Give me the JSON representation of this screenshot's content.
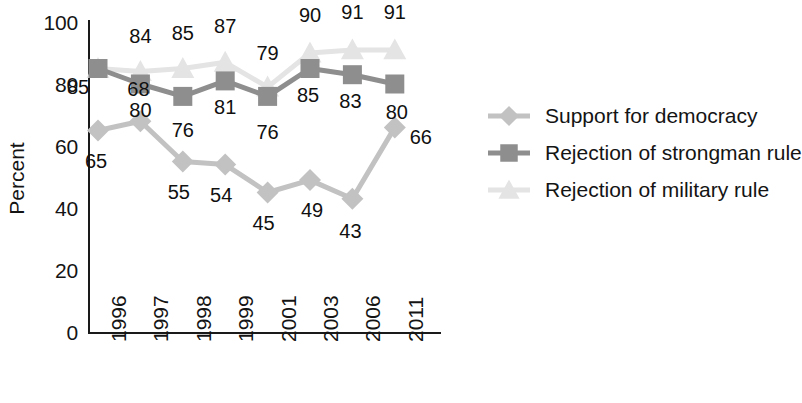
{
  "chart_data": {
    "type": "line",
    "title": "",
    "xlabel": "",
    "ylabel": "Percent",
    "ylim": [
      0,
      100
    ],
    "yticks": [
      0,
      20,
      40,
      60,
      80,
      100
    ],
    "grid": false,
    "legend_position": "right",
    "categories": [
      "1996",
      "1997",
      "1998",
      "1999",
      "2001",
      "2003",
      "2006",
      "2011"
    ],
    "series": [
      {
        "name": "Support for democracy",
        "marker": "diamond",
        "color": "#c2c2c2",
        "values": [
          65,
          68,
          55,
          54,
          45,
          49,
          43,
          66
        ],
        "labels": [
          "65",
          "68",
          "55",
          "54",
          "45",
          "49",
          "43",
          "66"
        ]
      },
      {
        "name": "Rejection of strongman rule",
        "marker": "square",
        "color": "#8e8e8e",
        "values": [
          85,
          80,
          76,
          81,
          76,
          85,
          83,
          80
        ],
        "labels": [
          "85",
          "80",
          "76",
          "81",
          "76",
          "85",
          "83",
          "80"
        ]
      },
      {
        "name": "Rejection of military rule",
        "marker": "triangle",
        "color": "#e4e4e4",
        "values": [
          85,
          84,
          85,
          87,
          79,
          90,
          91,
          91
        ],
        "labels": [
          "",
          "84",
          "85",
          "87",
          "79",
          "90",
          "91",
          "91"
        ]
      }
    ]
  },
  "axis": {
    "y_title": "Percent",
    "y_ticks": [
      "100",
      "80",
      "60",
      "40",
      "20",
      "0"
    ],
    "x_ticks": [
      "1996",
      "1997",
      "1998",
      "1999",
      "2001",
      "2003",
      "2006",
      "2011"
    ]
  },
  "legend": {
    "items": [
      {
        "label": "Support for democracy",
        "marker": "diamond-marker",
        "color": "#c2c2c2"
      },
      {
        "label": "Rejection of strongman rule",
        "marker": "square-marker",
        "color": "#8e8e8e"
      },
      {
        "label": "Rejection of military rule",
        "marker": "triangle-marker",
        "color": "#e4e4e4"
      }
    ]
  },
  "colors": {
    "axis": "#1a1a1a",
    "text": "#141414",
    "background": "#ffffff"
  }
}
